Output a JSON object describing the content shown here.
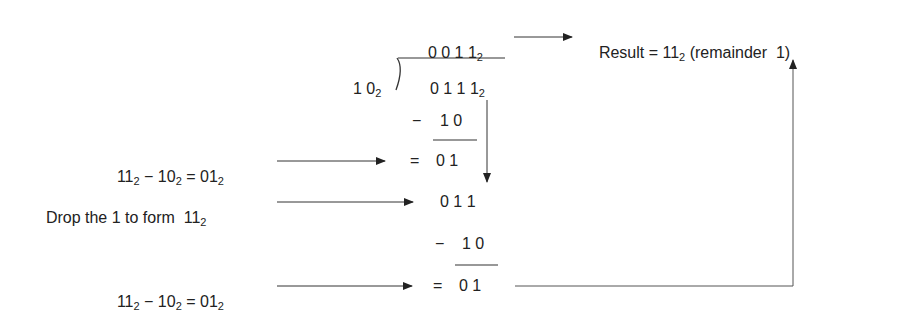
{
  "quotient": {
    "digits": "0 0 1 1",
    "base": "2"
  },
  "divisor": {
    "digits": "1 0",
    "base": "2"
  },
  "dividend": {
    "digits": "0 1 1 1",
    "base": "2"
  },
  "result": {
    "prefix": "Result = 11",
    "base": "2",
    "suffix": " (remainder  1)"
  },
  "step1": {
    "subtrahend": "1 0",
    "minus": "−",
    "equals": "=",
    "difference": "0 1",
    "annotation": {
      "a": "11",
      "b": "10",
      "c": "01",
      "base": "2",
      "op": " − ",
      "eq": " = "
    }
  },
  "step2": {
    "brought_down": "0 1 1",
    "annotation": {
      "text": "Drop the 1 to form  11",
      "base": "2"
    }
  },
  "step3": {
    "subtrahend": "1 0",
    "minus": "−",
    "equals": "=",
    "difference": "0 1",
    "annotation": {
      "a": "11",
      "b": "10",
      "c": "01",
      "base": "2",
      "op": " − ",
      "eq": " = "
    }
  },
  "colors": {
    "text": "#222222",
    "line": "#333333",
    "connector": "#555555"
  }
}
